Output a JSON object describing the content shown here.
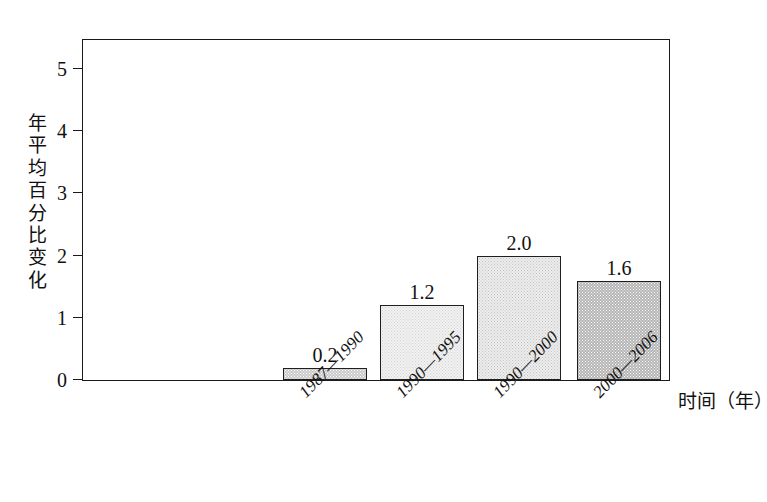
{
  "chart_data": {
    "type": "bar",
    "title": "",
    "xlabel": "时间（年）",
    "ylabel": "年平均百分比变化",
    "categories": [
      "1987—1990",
      "1990—1995",
      "1990—2000",
      "2000—2006"
    ],
    "values": [
      0.2,
      1.2,
      2.0,
      1.6
    ],
    "value_labels": [
      "0.2",
      "1.2",
      "2.0",
      "1.6"
    ],
    "ylim": [
      0,
      5.5
    ],
    "yticks": [
      0,
      1,
      2,
      3,
      4,
      5
    ],
    "ytick_labels": [
      "0",
      "1",
      "2",
      "3",
      "4",
      "5"
    ],
    "grid": false,
    "legend": false,
    "bar_fills": [
      "#c9c9c9",
      "#f2f2f2",
      "#ededed",
      "#b4b4b4"
    ],
    "frame_color": "#1a1a1a"
  },
  "axes": {
    "y_title": "年平均百分比变化",
    "x_title": "时间（年）"
  }
}
